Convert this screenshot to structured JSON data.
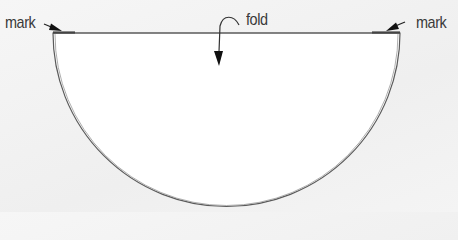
{
  "diagram": {
    "labels": {
      "mark_left": "mark",
      "mark_right": "mark",
      "fold": "fold"
    },
    "shape": {
      "type": "semicircle",
      "center_x": 226.5,
      "center_y": 33,
      "radius": 173.5,
      "fill": "#ffffff",
      "stroke": "#555555"
    },
    "colors": {
      "background": "#f2f2f2",
      "line": "#555555",
      "text": "#3a3a3a",
      "arrow": "#1a1a1a"
    }
  }
}
